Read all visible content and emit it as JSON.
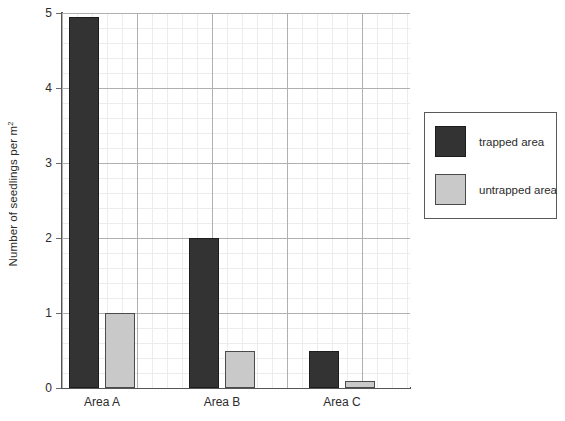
{
  "chart_data": {
    "type": "bar",
    "title": "",
    "xlabel": "",
    "ylabel": "Number of seedlings per m",
    "ylabel_superscript": "2",
    "categories": [
      "Area A",
      "Area B",
      "Area C"
    ],
    "series": [
      {
        "name": "trapped area",
        "color": "#333333",
        "values": [
          4.95,
          2.0,
          0.5
        ]
      },
      {
        "name": "untrapped area",
        "color": "#c9c9c9",
        "values": [
          1.0,
          0.5,
          0.1
        ]
      }
    ],
    "ylim": [
      0,
      5
    ],
    "yticks": [
      0,
      1,
      2,
      3,
      4,
      5
    ],
    "ytick_labels": [
      "0",
      "1",
      "2",
      "3",
      "4",
      "5"
    ],
    "grid": true,
    "grid_minor": true,
    "legend_position": "right-outside"
  },
  "legend": {
    "entries": [
      {
        "label": "trapped area",
        "swatch": "trapped"
      },
      {
        "label": "untrapped area",
        "swatch": "untrapped"
      }
    ]
  }
}
